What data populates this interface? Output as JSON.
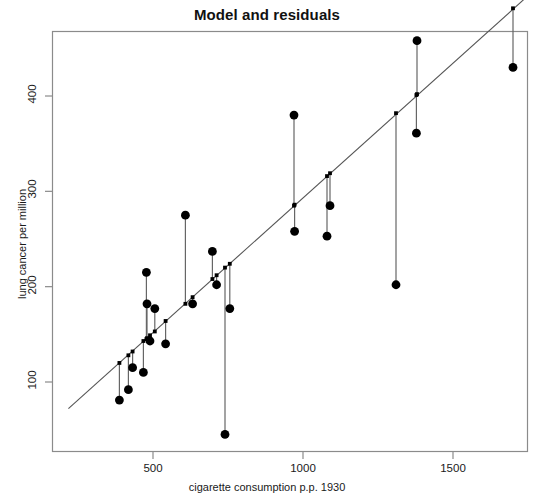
{
  "chart_data": {
    "type": "scatter",
    "title": "Model and residuals",
    "xlabel": "cigarette consumption p.p. 1930",
    "ylabel": "lung cancer per million",
    "xticks": [
      500,
      1000,
      1500
    ],
    "yticks": [
      100,
      200,
      300,
      400
    ],
    "xlim": [
      218,
      1760
    ],
    "ylim": [
      25,
      475
    ],
    "grid": false,
    "legend": null,
    "series": [
      {
        "name": "observations",
        "marker": "filled-circle",
        "color": "#000000",
        "points": [
          {
            "x": 388,
            "y": 81
          },
          {
            "x": 418,
            "y": 92
          },
          {
            "x": 432,
            "y": 115
          },
          {
            "x": 468,
            "y": 110
          },
          {
            "x": 478,
            "y": 215
          },
          {
            "x": 480,
            "y": 182
          },
          {
            "x": 490,
            "y": 143
          },
          {
            "x": 506,
            "y": 177
          },
          {
            "x": 542,
            "y": 140
          },
          {
            "x": 608,
            "y": 275
          },
          {
            "x": 632,
            "y": 182
          },
          {
            "x": 698,
            "y": 237
          },
          {
            "x": 712,
            "y": 202
          },
          {
            "x": 740,
            "y": 45
          },
          {
            "x": 756,
            "y": 177
          },
          {
            "x": 970,
            "y": 380
          },
          {
            "x": 972,
            "y": 258
          },
          {
            "x": 1080,
            "y": 253
          },
          {
            "x": 1090,
            "y": 285
          },
          {
            "x": 1310,
            "y": 202
          },
          {
            "x": 1380,
            "y": 458
          },
          {
            "x": 1378,
            "y": 361
          },
          {
            "x": 1700,
            "y": 430
          }
        ]
      },
      {
        "name": "fitted values",
        "marker": "small-square",
        "color": "#000000",
        "points": [
          {
            "x": 388,
            "y": 120
          },
          {
            "x": 418,
            "y": 128
          },
          {
            "x": 432,
            "y": 132
          },
          {
            "x": 468,
            "y": 143
          },
          {
            "x": 478,
            "y": 145
          },
          {
            "x": 480,
            "y": 146
          },
          {
            "x": 490,
            "y": 149
          },
          {
            "x": 506,
            "y": 153
          },
          {
            "x": 542,
            "y": 164
          },
          {
            "x": 608,
            "y": 182
          },
          {
            "x": 632,
            "y": 189
          },
          {
            "x": 698,
            "y": 208
          },
          {
            "x": 712,
            "y": 212
          },
          {
            "x": 740,
            "y": 220
          },
          {
            "x": 756,
            "y": 224
          },
          {
            "x": 970,
            "y": 285
          },
          {
            "x": 972,
            "y": 286
          },
          {
            "x": 1080,
            "y": 316
          },
          {
            "x": 1090,
            "y": 319
          },
          {
            "x": 1310,
            "y": 382
          },
          {
            "x": 1380,
            "y": 402
          },
          {
            "x": 1378,
            "y": 401
          },
          {
            "x": 1700,
            "y": 492
          }
        ]
      }
    ],
    "regression_line": {
      "name": "fitted regression line",
      "color": "#555555",
      "x_start": 218,
      "y_start": 72,
      "x_end": 1760,
      "y_end": 508
    },
    "residual_segments": {
      "name": "residual segments",
      "color": "#666666"
    }
  }
}
